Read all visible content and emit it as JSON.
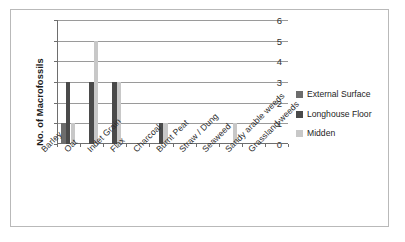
{
  "chart_data": {
    "type": "bar",
    "title": "",
    "subtitle": "",
    "xlabel": "",
    "ylabel": "No. of Macrofossils",
    "ylim": [
      0,
      6
    ],
    "yticks": [
      0,
      1,
      2,
      3,
      4,
      5,
      6
    ],
    "grid": true,
    "legend_position": "right",
    "categories": [
      "Barley",
      "Oat",
      "Indet Grain",
      "Flax",
      "Charcoal",
      "Burnt Peat",
      "Straw / Dung",
      "Seaweed",
      "Sandy arable weeds",
      "Grassland weeds"
    ],
    "series": [
      {
        "name": "External Surface",
        "color": "#6d6d6d",
        "values": [
          1,
          0,
          0,
          0,
          0,
          0,
          0,
          0,
          0,
          0
        ]
      },
      {
        "name": "Longhouse Floor",
        "color": "#4a4a4a",
        "values": [
          3,
          3,
          3,
          0,
          1,
          0,
          0,
          0,
          0,
          0
        ]
      },
      {
        "name": "Midden",
        "color": "#c8c8c8",
        "values": [
          1,
          5,
          3,
          0,
          1,
          0,
          0,
          1,
          0,
          0
        ]
      }
    ]
  },
  "axis": {
    "y_title": "No. of Macrofossils",
    "y_tick_labels": [
      "0",
      "1",
      "2",
      "3",
      "4",
      "5",
      "6"
    ]
  },
  "legend": {
    "items": [
      {
        "label": "External Surface",
        "color": "#6d6d6d"
      },
      {
        "label": "Longhouse Floor",
        "color": "#4a4a4a"
      },
      {
        "label": "Midden",
        "color": "#c8c8c8"
      }
    ]
  }
}
